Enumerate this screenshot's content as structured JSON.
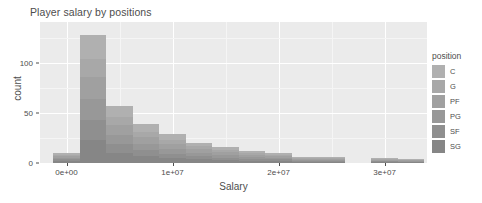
{
  "chart_data": {
    "type": "bar",
    "title": "Player salary by positions",
    "xlabel": "Salary",
    "ylabel": "count",
    "xlim": [
      -2500000,
      34000000
    ],
    "ylim": [
      0,
      141
    ],
    "grid": true,
    "legend_position": "right",
    "legend_title": "position",
    "xticks": [
      0,
      10000000,
      20000000,
      30000000
    ],
    "xtick_labels": [
      "0e+00",
      "1e+07",
      "2e+07",
      "3e+07"
    ],
    "yticks": [
      0,
      50,
      100
    ],
    "ytick_labels": [
      "0",
      "50",
      "100"
    ],
    "bin_width": 2500000,
    "series": [
      {
        "name": "C",
        "color": "#b0b0b0",
        "values": [
          2,
          24,
          11,
          8,
          6,
          3,
          3,
          2,
          2,
          1,
          1,
          0,
          1,
          1,
          0
        ]
      },
      {
        "name": "G",
        "color": "#a8a8a8",
        "values": [
          1,
          18,
          8,
          5,
          4,
          3,
          2,
          2,
          1,
          1,
          1,
          0,
          1,
          0,
          0
        ]
      },
      {
        "name": "PF",
        "color": "#a0a0a0",
        "values": [
          2,
          22,
          10,
          7,
          5,
          4,
          3,
          2,
          2,
          1,
          1,
          0,
          1,
          1,
          0
        ]
      },
      {
        "name": "PG",
        "color": "#989898",
        "values": [
          1,
          21,
          9,
          6,
          5,
          3,
          3,
          2,
          1,
          1,
          1,
          0,
          0,
          1,
          0
        ]
      },
      {
        "name": "SF",
        "color": "#8f8f8f",
        "values": [
          2,
          20,
          9,
          6,
          4,
          3,
          2,
          2,
          2,
          1,
          1,
          0,
          1,
          0,
          0
        ]
      },
      {
        "name": "SG",
        "color": "#868686",
        "values": [
          2,
          23,
          10,
          7,
          5,
          4,
          3,
          2,
          2,
          1,
          1,
          0,
          1,
          1,
          0
        ]
      }
    ],
    "bin_starts": [
      -1250000,
      1250000,
      3750000,
      6250000,
      8750000,
      11250000,
      13750000,
      16250000,
      18750000,
      21250000,
      23750000,
      26250000,
      28750000,
      31250000,
      33750000
    ],
    "bin_totals": [
      10,
      128,
      57,
      39,
      29,
      20,
      16,
      12,
      10,
      6,
      6,
      0,
      5,
      4,
      0
    ]
  },
  "legend": {
    "title": "position",
    "items": [
      {
        "label": "C",
        "color": "#b0b0b0"
      },
      {
        "label": "G",
        "color": "#a8a8a8"
      },
      {
        "label": "PF",
        "color": "#a0a0a0"
      },
      {
        "label": "PG",
        "color": "#989898"
      },
      {
        "label": "SF",
        "color": "#8f8f8f"
      },
      {
        "label": "SG",
        "color": "#868686"
      }
    ]
  },
  "theme": {
    "panel_background": "#ebebeb",
    "grid_major_color": "#ffffff",
    "grid_minor_color": "#f5f5f5",
    "text_color": "#4d4d4d",
    "plot_background": "#ffffff"
  }
}
